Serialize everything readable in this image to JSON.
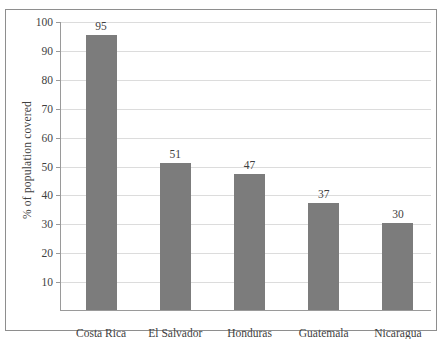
{
  "chart_data": {
    "type": "bar",
    "title": "",
    "xlabel": "",
    "ylabel": "% of population covered",
    "categories": [
      "Costa Rica",
      "El Salvador",
      "Honduras",
      "Guatemala",
      "Nicaragua"
    ],
    "values": [
      95,
      51,
      47,
      37,
      30
    ],
    "value_labels": [
      "95",
      "51",
      "47",
      "37",
      "30"
    ],
    "ylim": [
      0,
      100
    ],
    "ytick_labels": [
      "100",
      "90",
      "80",
      "70",
      "60",
      "50",
      "40",
      "30",
      "20",
      "10"
    ],
    "ytick_values": [
      100,
      90,
      80,
      70,
      60,
      50,
      40,
      30,
      20,
      10
    ],
    "grid": true,
    "legend": "none",
    "colors": {
      "bar": "#7c7c7c",
      "gridline": "#dcdcdc",
      "axis": "#9a9a9a",
      "frame": "#8e8e8e",
      "background": "#ffffff",
      "text": "#3f3f3f"
    }
  }
}
